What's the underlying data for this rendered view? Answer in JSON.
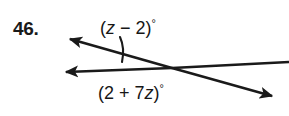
{
  "problem": {
    "number": "46."
  },
  "figure": {
    "type": "two-intersecting-rays-angle-diagram",
    "background_color": "#ffffff",
    "stroke_color": "#1a1a1a",
    "angle_labels": [
      {
        "id": "top-angle",
        "expression": "(z − 2)",
        "lead": "(",
        "variable": "z",
        "operator": " − 2)",
        "degree_symbol": "°",
        "full_text": "(z − 2)°"
      },
      {
        "id": "bottom-angle",
        "expression": "(2 + 7z)",
        "lead": "(2 + 7",
        "variable": "z",
        "operator": ")",
        "degree_symbol": "°",
        "full_text": "(2 + 7z)°"
      }
    ],
    "geometry": {
      "intersection_point": [
        172,
        68
      ],
      "ray_upper_left_arrow_tip": [
        66,
        37
      ],
      "ray_lower_left_arrow_tip": [
        62,
        72
      ],
      "ray_lower_right_arrow_tip": [
        276,
        98
      ],
      "ray_right_end": [
        284,
        64
      ],
      "arc_marker_center": [
        172,
        68
      ],
      "arc_marker_radius": 58
    }
  }
}
